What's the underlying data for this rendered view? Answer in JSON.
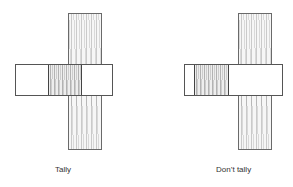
{
  "figure": {
    "panels": [
      {
        "id": "tally",
        "label": "Tally",
        "description": "Horizontal bar crosses vertical plank; shaded section aligned with plank"
      },
      {
        "id": "dont-tally",
        "label": "Don’t tally",
        "description": "Horizontal bar crosses vertical plank; shaded section offset to the left of plank"
      }
    ]
  }
}
